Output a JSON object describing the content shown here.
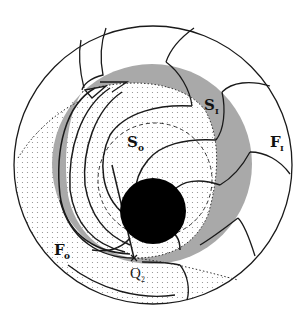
{
  "figure": {
    "kind": "phase-space / stable-manifold diagram",
    "colors": {
      "background": "#ffffff",
      "outline": "#1a1a1a",
      "gray_annulus": "#a9a9a9",
      "dot_fill": "#8a8a8a",
      "center_disk": "#000000"
    },
    "labels": {
      "S_I": {
        "main": "S",
        "sub": "I"
      },
      "F_I": {
        "main": "F",
        "sub": "I"
      },
      "S_O": {
        "main": "S",
        "sub": "o"
      },
      "F_O": {
        "main": "F",
        "sub": "o"
      },
      "Q_2": {
        "main": "Q",
        "sub": "2"
      }
    },
    "regions": [
      {
        "name": "outer-circle",
        "description": "outer boundary circle"
      },
      {
        "name": "gray-annulus",
        "description": "shaded region S_I"
      },
      {
        "name": "dotted-region",
        "description": "stippled region containing S_o and F_o"
      },
      {
        "name": "center-disk",
        "description": "solid black disk"
      },
      {
        "name": "dashed-circle",
        "description": "dashed inner circle"
      },
      {
        "name": "point-q2",
        "description": "marked crossing point Q_2"
      }
    ]
  }
}
